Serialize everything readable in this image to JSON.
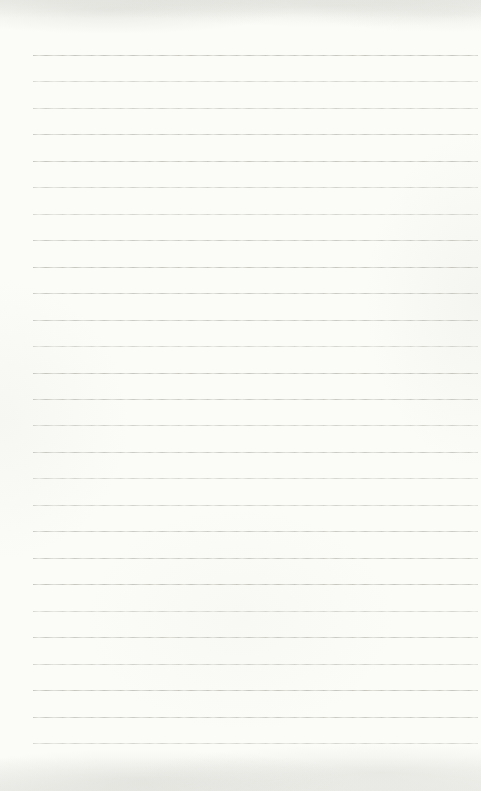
{
  "page": {
    "kind": "blank-ruled-notebook-page",
    "text_content": "",
    "line_count": 27
  },
  "colors": {
    "paper": "#fbfbf8",
    "rule_line": "#c6c6bf"
  }
}
